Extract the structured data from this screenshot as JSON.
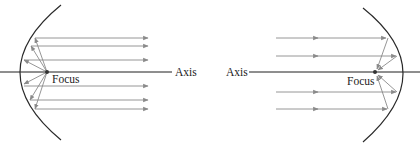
{
  "diagram": {
    "colors": {
      "mirror": "#2a2a2a",
      "axis": "#1e1e1e",
      "ray": "#8a8a8a",
      "focus": "#333333",
      "text": "#222222"
    },
    "left_panel": {
      "description": "Light from the focus reflects off the parabola into parallel rays",
      "focus_label": "Focus",
      "axis_label": "Axis",
      "parallel_ray_count": 6
    },
    "right_panel": {
      "description": "Parallel incoming rays reflect off the parabola and converge at the focus",
      "focus_label": "Focus",
      "axis_label": "Axis",
      "parallel_ray_count": 4
    }
  }
}
